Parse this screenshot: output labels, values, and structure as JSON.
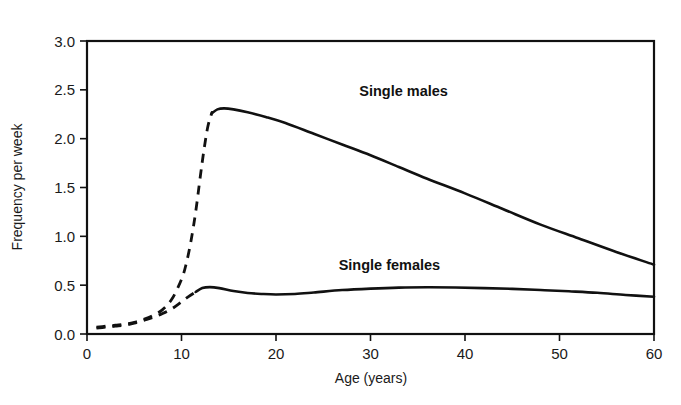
{
  "chart_data": {
    "type": "line",
    "title": "",
    "xlabel": "Age (years)",
    "ylabel": "Frequency per week",
    "xlim": [
      0,
      60
    ],
    "ylim": [
      0,
      3.0
    ],
    "xticks": [
      0,
      10,
      20,
      30,
      40,
      50,
      60
    ],
    "xtick_labels": [
      "0",
      "10",
      "20",
      "30",
      "40",
      "50",
      "60"
    ],
    "yticks": [
      0.0,
      0.5,
      1.0,
      1.5,
      2.0,
      2.5,
      3.0
    ],
    "ytick_labels": [
      "0.0",
      "0.5",
      "1.0",
      "1.5",
      "2.0",
      "2.5",
      "3.0"
    ],
    "grid": false,
    "legend_position": "inline-annotation",
    "frame": "box",
    "line_color": "#111111",
    "background_color": "#ffffff",
    "series": [
      {
        "name": "Single males",
        "label": "Single males",
        "label_x": 33.5,
        "label_y": 2.44,
        "dashed_until_x": 13.2,
        "x": [
          1.0,
          2.0,
          3.0,
          4.0,
          5.0,
          6.0,
          7.0,
          8.0,
          9.0,
          10.0,
          10.5,
          11.0,
          11.5,
          12.0,
          12.4,
          12.8,
          13.2,
          13.8,
          14.5,
          15.5,
          17.0,
          19.0,
          21.0,
          24.0,
          27.0,
          30.0,
          33.0,
          36.0,
          40.0,
          44.0,
          48.0,
          52.0,
          56.0,
          60.0
        ],
        "y": [
          0.07,
          0.08,
          0.09,
          0.1,
          0.12,
          0.15,
          0.19,
          0.25,
          0.36,
          0.56,
          0.72,
          0.95,
          1.25,
          1.62,
          1.9,
          2.13,
          2.26,
          2.3,
          2.31,
          2.3,
          2.27,
          2.22,
          2.16,
          2.05,
          1.94,
          1.83,
          1.71,
          1.59,
          1.44,
          1.28,
          1.12,
          0.98,
          0.84,
          0.71
        ]
      },
      {
        "name": "Single females",
        "label": "Single females",
        "label_x": 32.0,
        "label_y": 0.66,
        "dashed_until_x": 11.5,
        "x": [
          1.0,
          2.0,
          3.0,
          4.0,
          5.0,
          6.0,
          7.0,
          8.0,
          9.0,
          10.0,
          10.7,
          11.5,
          12.2,
          13.0,
          14.0,
          15.5,
          17.0,
          18.5,
          20.0,
          22.0,
          24.0,
          27.0,
          30.0,
          33.0,
          36.0,
          39.0,
          42.0,
          45.0,
          48.0,
          51.0,
          54.0,
          57.0,
          60.0
        ],
        "y": [
          0.06,
          0.07,
          0.08,
          0.09,
          0.11,
          0.14,
          0.17,
          0.21,
          0.26,
          0.33,
          0.38,
          0.43,
          0.47,
          0.48,
          0.47,
          0.44,
          0.42,
          0.41,
          0.405,
          0.41,
          0.425,
          0.45,
          0.465,
          0.475,
          0.478,
          0.476,
          0.47,
          0.462,
          0.45,
          0.437,
          0.422,
          0.4,
          0.382
        ]
      }
    ]
  },
  "axes": {
    "x_title": "Age (years)",
    "y_title": "Frequency per week"
  }
}
